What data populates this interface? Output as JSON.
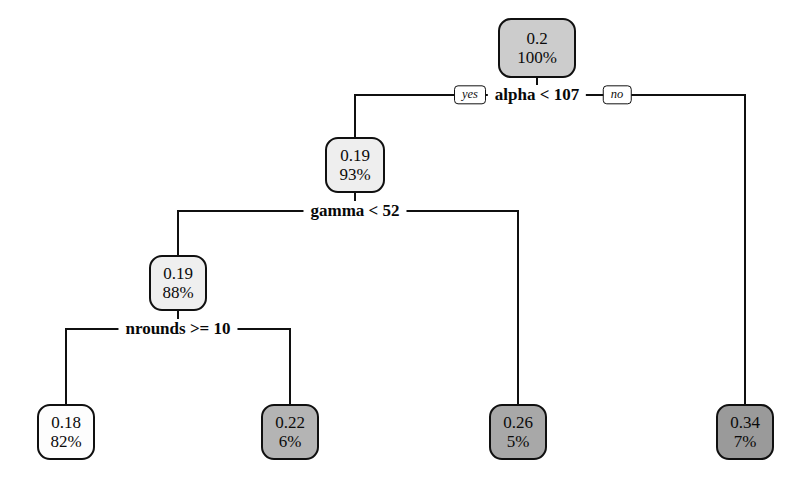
{
  "figure": {
    "type": "decision-tree",
    "background": "#ffffff",
    "stroke_color": "#101010"
  },
  "branch_labels": {
    "yes": "yes",
    "no": "no"
  },
  "splits": [
    {
      "id": "split-alpha",
      "label": "alpha < 107",
      "x": 537,
      "y": 95,
      "left_x": 355,
      "right_x": 745
    },
    {
      "id": "split-gamma",
      "label": "gamma < 52",
      "x": 355,
      "y": 211,
      "left_x": 178,
      "right_x": 518
    },
    {
      "id": "split-nrounds",
      "label": "nrounds >= 10",
      "x": 178,
      "y": 329,
      "left_x": 66,
      "right_x": 290
    }
  ],
  "nodes": [
    {
      "id": "node-root",
      "value": "0.2",
      "percent": "100%",
      "fill": "#cccccc",
      "x": 537,
      "y": 48,
      "w": 78,
      "h": 60,
      "kind": "internal"
    },
    {
      "id": "node-alpha-yes",
      "value": "0.19",
      "percent": "93%",
      "fill": "#eeeeee",
      "x": 355,
      "y": 165,
      "w": 60,
      "h": 56,
      "kind": "internal"
    },
    {
      "id": "node-gamma-yes",
      "value": "0.19",
      "percent": "88%",
      "fill": "#efefef",
      "x": 178,
      "y": 283,
      "w": 58,
      "h": 56,
      "kind": "internal"
    },
    {
      "id": "leaf-018",
      "value": "0.18",
      "percent": "82%",
      "fill": "#fdfdfd",
      "x": 66,
      "y": 432,
      "w": 58,
      "h": 56,
      "kind": "leaf"
    },
    {
      "id": "leaf-022",
      "value": "0.22",
      "percent": "6%",
      "fill": "#b4b4b4",
      "x": 290,
      "y": 432,
      "w": 58,
      "h": 56,
      "kind": "leaf"
    },
    {
      "id": "leaf-026",
      "value": "0.26",
      "percent": "5%",
      "fill": "#a8a8a8",
      "x": 518,
      "y": 432,
      "w": 58,
      "h": 56,
      "kind": "leaf"
    },
    {
      "id": "leaf-034",
      "value": "0.34",
      "percent": "7%",
      "fill": "#9a9a9a",
      "x": 745,
      "y": 432,
      "w": 58,
      "h": 56,
      "kind": "leaf"
    }
  ],
  "chart_data": {
    "type": "tree",
    "title": "",
    "root": {
      "value": 0.2,
      "percent": "100%",
      "split": "alpha < 107",
      "children": [
        {
          "branch": "yes",
          "value": 0.19,
          "percent": "93%",
          "split": "gamma < 52",
          "children": [
            {
              "branch": "yes",
              "value": 0.19,
              "percent": "88%",
              "split": "nrounds >= 10",
              "children": [
                {
                  "branch": "yes",
                  "value": 0.18,
                  "percent": "82%",
                  "leaf": true
                },
                {
                  "branch": "no",
                  "value": 0.22,
                  "percent": "6%",
                  "leaf": true
                }
              ]
            },
            {
              "branch": "no",
              "value": 0.26,
              "percent": "5%",
              "leaf": true
            }
          ]
        },
        {
          "branch": "no",
          "value": 0.34,
          "percent": "7%",
          "leaf": true
        }
      ]
    },
    "leaf_values": [
      0.18,
      0.22,
      0.26,
      0.34
    ],
    "leaf_percents": [
      "82%",
      "6%",
      "5%",
      "7%"
    ],
    "split_variables": [
      "alpha",
      "gamma",
      "nrounds"
    ]
  }
}
